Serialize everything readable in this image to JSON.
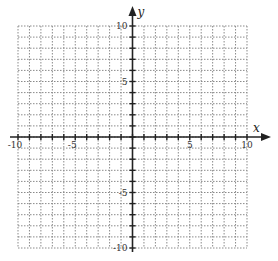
{
  "diagram": {
    "type": "coordinate-plane",
    "x_axis": {
      "label": "x",
      "min": -10,
      "max": 10,
      "tick_step": 1,
      "tick_labels": [
        {
          "value": -10,
          "text": "-10"
        },
        {
          "value": -5,
          "text": "-5"
        },
        {
          "value": 5,
          "text": "5"
        },
        {
          "value": 10,
          "text": "10"
        }
      ]
    },
    "y_axis": {
      "label": "y",
      "min": -10,
      "max": 10,
      "tick_step": 1,
      "tick_labels": [
        {
          "value": 10,
          "text": "10"
        },
        {
          "value": 5,
          "text": "5"
        },
        {
          "value": -5,
          "text": "-5"
        },
        {
          "value": -10,
          "text": "-10"
        }
      ]
    },
    "grid": {
      "style": "dotted",
      "color": "#8a8a8a"
    },
    "axis_color": "#222222"
  }
}
